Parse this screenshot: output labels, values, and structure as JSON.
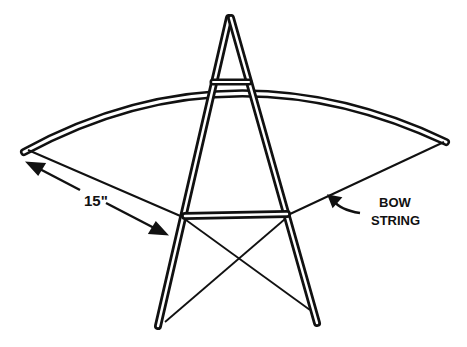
{
  "diagram": {
    "type": "kite-frame-sketch",
    "labels": {
      "dimension": "15\"",
      "bow_string_line1": "BOW",
      "bow_string_line2": "STRING"
    },
    "colors": {
      "ink": "#111111",
      "background": "#ffffff"
    }
  }
}
